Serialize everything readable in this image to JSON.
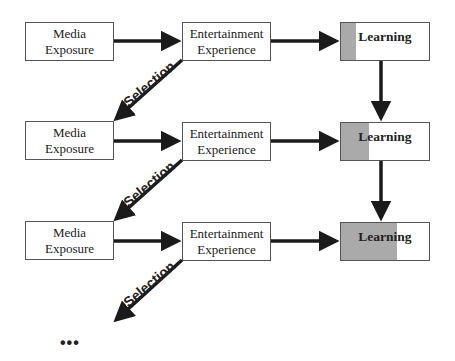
{
  "rows": [
    {
      "media": [
        "Media",
        "Exposure"
      ],
      "entertainment": [
        "Entertainment",
        "Experience"
      ],
      "learning": "Learning",
      "learning_fill_pct": 17
    },
    {
      "media": [
        "Media",
        "Exposure"
      ],
      "entertainment": [
        "Entertainment",
        "Experience"
      ],
      "learning": "Learning",
      "learning_fill_pct": 31
    },
    {
      "media": [
        "Media",
        "Exposure"
      ],
      "entertainment": [
        "Entertainment",
        "Experience"
      ],
      "learning": "Learning",
      "learning_fill_pct": 62
    }
  ],
  "selection_label": "Selection",
  "continuation": "•••",
  "colors": {
    "fill": "#aaaaaa",
    "border": "#555555",
    "arrow": "#1a1a1a"
  }
}
